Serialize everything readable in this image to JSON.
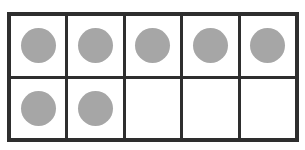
{
  "ten_frame": {
    "rows": 2,
    "columns": 5,
    "filled_count": 7,
    "total_cells": 10,
    "cells": [
      {
        "filled": true
      },
      {
        "filled": true
      },
      {
        "filled": true
      },
      {
        "filled": true
      },
      {
        "filled": true
      },
      {
        "filled": true
      },
      {
        "filled": true
      },
      {
        "filled": false
      },
      {
        "filled": false
      },
      {
        "filled": false
      }
    ],
    "colors": {
      "border": "#2e2e2e",
      "counter": "#a6a6a6",
      "background": "#ffffff"
    }
  }
}
